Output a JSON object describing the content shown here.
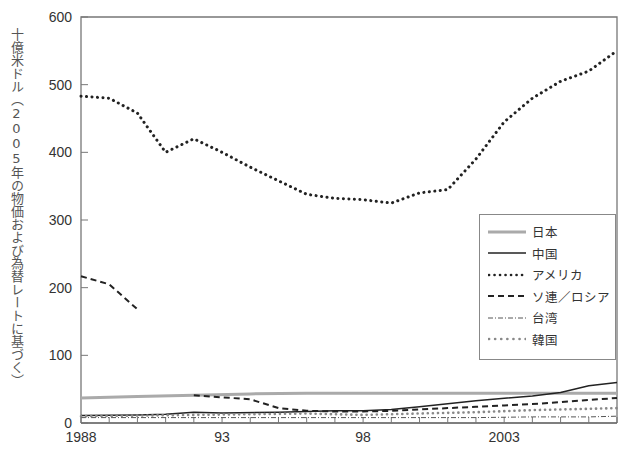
{
  "chart_data": {
    "type": "line",
    "title": "",
    "xlabel": "",
    "ylabel": "十億米ドル（2005年の物価および為替レートに基づく）",
    "xlim": [
      1988,
      2007
    ],
    "ylim": [
      0,
      600
    ],
    "yticks": [
      0,
      100,
      200,
      300,
      400,
      500,
      600
    ],
    "xtick_labels": [
      {
        "x": 1988,
        "label": "1988"
      },
      {
        "x": 1993,
        "label": "93"
      },
      {
        "x": 1998,
        "label": "98"
      },
      {
        "x": 2003,
        "label": "2003"
      }
    ],
    "grid": false,
    "legend_position": "right-middle",
    "series": [
      {
        "name": "日本",
        "style": "solid-thick-gray",
        "x": [
          1988,
          1990,
          1992,
          1994,
          1996,
          1998,
          2000,
          2002,
          2004,
          2005,
          2007
        ],
        "values": [
          37,
          39,
          41,
          43,
          44,
          44,
          44,
          44,
          44,
          44,
          44
        ]
      },
      {
        "name": "中国",
        "style": "solid",
        "x": [
          1988,
          1990,
          1991,
          1992,
          1993,
          1995,
          1997,
          1998,
          1999,
          2000,
          2002,
          2004,
          2005,
          2006,
          2007
        ],
        "values": [
          11,
          12,
          13,
          16,
          15,
          16,
          18,
          18,
          20,
          24,
          33,
          40,
          45,
          55,
          60
        ]
      },
      {
        "name": "アメリカ",
        "style": "dotted-bold",
        "x": [
          1988,
          1989,
          1990,
          1991,
          1992,
          1993,
          1994,
          1995,
          1996,
          1997,
          1998,
          1999,
          2000,
          2001,
          2002,
          2003,
          2004,
          2005,
          2006,
          2007
        ],
        "values": [
          483,
          480,
          458,
          400,
          420,
          400,
          378,
          358,
          338,
          332,
          330,
          325,
          340,
          345,
          390,
          445,
          480,
          505,
          520,
          550
        ]
      },
      {
        "name": "ソ連／ロシア",
        "style": "dashed",
        "x": [
          1988,
          1989,
          1990,
          1992,
          1993,
          1994,
          1995,
          1996,
          1997,
          1998,
          1999,
          2000,
          2001,
          2002,
          2003,
          2004,
          2005,
          2006,
          2007
        ],
        "values": [
          217,
          205,
          168,
          41,
          38,
          35,
          22,
          18,
          17,
          17,
          18,
          20,
          22,
          24,
          26,
          28,
          31,
          34,
          37
        ]
      },
      {
        "name": "台湾",
        "style": "dash-dot",
        "x": [
          1988,
          1990,
          1992,
          1994,
          1996,
          1998,
          2000,
          2002,
          2004,
          2006,
          2007
        ],
        "values": [
          8,
          8,
          8,
          8,
          8,
          8,
          8,
          8,
          9,
          9,
          10
        ]
      },
      {
        "name": "韓国",
        "style": "dotted-gray",
        "x": [
          1988,
          1990,
          1992,
          1994,
          1996,
          1998,
          2000,
          2002,
          2004,
          2006,
          2007
        ],
        "values": [
          10,
          11,
          12,
          13,
          14,
          12,
          14,
          16,
          19,
          21,
          22
        ]
      }
    ]
  },
  "legend": {
    "items": [
      {
        "label": "日本"
      },
      {
        "label": "中国"
      },
      {
        "label": "アメリカ"
      },
      {
        "label": "ソ連／ロシア"
      },
      {
        "label": "台湾"
      },
      {
        "label": "韓国"
      }
    ]
  }
}
